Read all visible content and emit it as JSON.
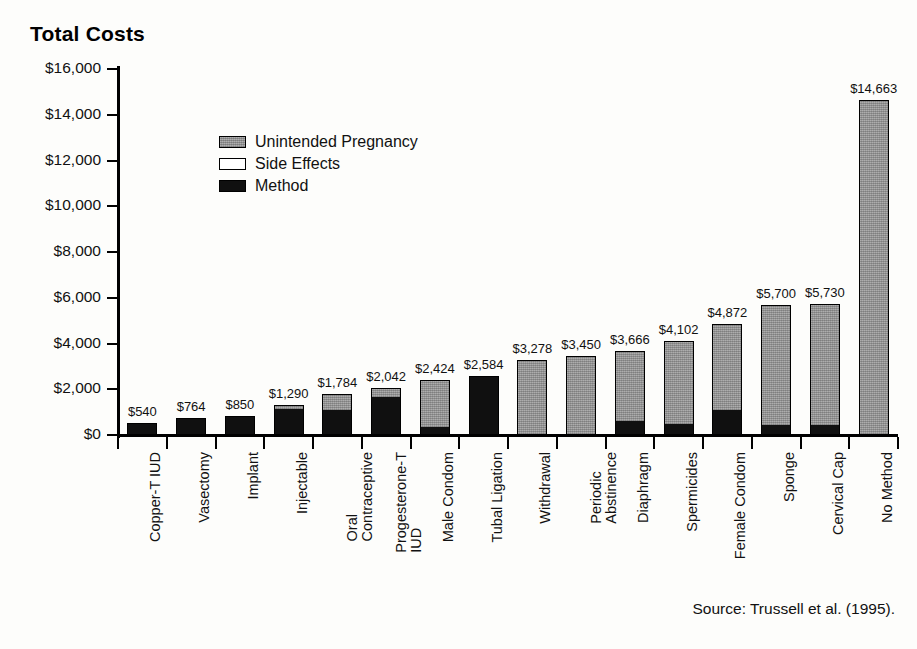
{
  "title": "Total Costs",
  "source": "Source: Trussell et al. (1995).",
  "legend": [
    {
      "key": "unintended_pregnancy",
      "label": "Unintended Pregnancy",
      "swatch": "gray"
    },
    {
      "key": "side_effects",
      "label": "Side Effects",
      "swatch": "white"
    },
    {
      "key": "method",
      "label": "Method",
      "swatch": "black"
    }
  ],
  "y_axis": {
    "ticks": [
      "$0",
      "$2,000",
      "$4,000",
      "$6,000",
      "$8,000",
      "$10,000",
      "$12,000",
      "$14,000",
      "$16,000"
    ]
  },
  "chart_data": {
    "type": "bar",
    "subtype": "stacked",
    "title": "Total Costs",
    "xlabel": "",
    "ylabel": "Total Costs",
    "ylim": [
      0,
      16000
    ],
    "ytick_step": 2000,
    "grid": false,
    "legend_position": "inside-upper-left",
    "annotation": "Source: Trussell et al. (1995).",
    "colors": {
      "method": "#101010",
      "side_effects": "#ffffff",
      "unintended_pregnancy": "#9b9b9b"
    },
    "categories": [
      "Copper-T IUD",
      "Vasectomy",
      "Implant",
      "Injectable",
      "Oral Contraceptive",
      "Progesterone-T IUD",
      "Male Condom",
      "Tubal Ligation",
      "Withdrawal",
      "Periodic Abstinence",
      "Diaphragm",
      "Spermicides",
      "Female Condom",
      "Sponge",
      "Cervical Cap",
      "No Method"
    ],
    "category_lines": [
      [
        "Copper-T IUD"
      ],
      [
        "Vasectomy"
      ],
      [
        "Implant"
      ],
      [
        "Injectable"
      ],
      [
        "Oral",
        "Contraceptive"
      ],
      [
        "Progesterone-T",
        "IUD"
      ],
      [
        "Male Condom"
      ],
      [
        "Tubal Ligation"
      ],
      [
        "Withdrawal"
      ],
      [
        "Periodic",
        "Abstinence"
      ],
      [
        "Diaphragm"
      ],
      [
        "Spermicides"
      ],
      [
        "Female Condom"
      ],
      [
        "Sponge"
      ],
      [
        "Cervical Cap"
      ],
      [
        "No Method"
      ]
    ],
    "series": [
      {
        "name": "Method",
        "values": [
          540,
          764,
          850,
          1190,
          1100,
          1700,
          300,
          2584,
          0,
          0,
          600,
          440,
          1050,
          400,
          400,
          0
        ]
      },
      {
        "name": "Side Effects",
        "values": [
          0,
          0,
          0,
          0,
          0,
          0,
          0,
          0,
          0,
          0,
          0,
          0,
          0,
          0,
          0,
          0
        ]
      },
      {
        "name": "Unintended Pregnancy",
        "values": [
          0,
          0,
          0,
          100,
          684,
          342,
          2124,
          0,
          3278,
          3450,
          3066,
          3662,
          3822,
          5300,
          5330,
          14663
        ]
      }
    ],
    "totals": [
      540,
      764,
      850,
      1290,
      1784,
      2042,
      2424,
      2584,
      3278,
      3450,
      3666,
      4102,
      4872,
      5700,
      5730,
      14663
    ],
    "total_labels": [
      "$540",
      "$764",
      "$850",
      "$1,290",
      "$1,784",
      "$2,042",
      "$2,424",
      "$2,584",
      "$3,278",
      "$3,450",
      "$3,666",
      "$4,102",
      "$4,872",
      "$5,700",
      "$5,730",
      "$14,663"
    ]
  }
}
